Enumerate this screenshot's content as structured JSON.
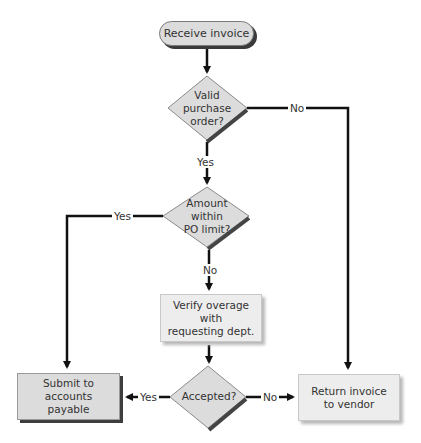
{
  "diagram": {
    "type": "flowchart",
    "nodes": {
      "start": {
        "label": "Receive invoice",
        "shape": "terminator"
      },
      "valid_po": {
        "label": "Valid purchase order?",
        "lines": [
          "Valid",
          "purchase",
          "order?"
        ],
        "shape": "decision"
      },
      "within_limit": {
        "label": "Amount within PO limit?",
        "lines": [
          "Amount",
          "within",
          "PO limit?"
        ],
        "shape": "decision"
      },
      "verify": {
        "label": "Verify overage with requesting dept.",
        "lines": [
          "Verify overage with",
          "requesting dept."
        ],
        "shape": "process"
      },
      "accepted": {
        "label": "Accepted?",
        "shape": "decision"
      },
      "submit": {
        "label": "Submit to accounts payable",
        "lines": [
          "Submit to accounts",
          "payable"
        ],
        "shape": "process"
      },
      "return": {
        "label": "Return invoice to vendor",
        "lines": [
          "Return invoice",
          "to vendor"
        ],
        "shape": "process"
      }
    },
    "edges": [
      {
        "from": "start",
        "to": "valid_po",
        "label": ""
      },
      {
        "from": "valid_po",
        "to": "within_limit",
        "label": "Yes"
      },
      {
        "from": "valid_po",
        "to": "return",
        "label": "No"
      },
      {
        "from": "within_limit",
        "to": "submit",
        "label": "Yes"
      },
      {
        "from": "within_limit",
        "to": "verify",
        "label": "No"
      },
      {
        "from": "verify",
        "to": "accepted",
        "label": ""
      },
      {
        "from": "accepted",
        "to": "submit",
        "label": "Yes"
      },
      {
        "from": "accepted",
        "to": "return",
        "label": "No"
      }
    ],
    "edge_labels": {
      "valid_po_no": "No",
      "valid_po_yes": "Yes",
      "within_limit_yes": "Yes",
      "within_limit_no": "No",
      "accepted_yes": "Yes",
      "accepted_no": "No"
    },
    "colors": {
      "fill_dark": "#dcdcdc",
      "fill_light": "#ededed",
      "shadow": "#3a3a3a",
      "line": "#111111",
      "text": "#333333"
    }
  }
}
